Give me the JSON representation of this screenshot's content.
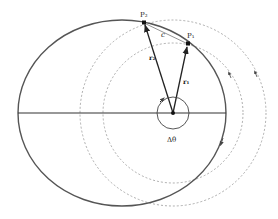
{
  "diagram": {
    "labels": {
      "point_2": "P₂",
      "point_1": "P₁",
      "chord": "c",
      "vector_2": "r₂",
      "vector_1": "r₁",
      "angle": "Δθ"
    },
    "colors": {
      "orbit": "#555555",
      "dashed_circles": "#999999",
      "vectors": "#222222",
      "background": "#ffffff"
    },
    "elements": {
      "orbit": "ellipse",
      "major_axis": "horizontal line",
      "focus": "dot at vector origin",
      "dashed_circles": 2,
      "position_vectors": [
        "r2 to P2",
        "r1 to P1"
      ],
      "angle_marker": "circle arc with arrow around focus"
    }
  }
}
